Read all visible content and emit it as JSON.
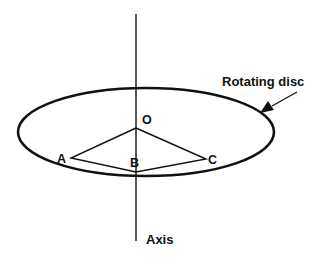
{
  "diagram": {
    "title_label": "Rotating disc",
    "axis_label": "Axis",
    "points": {
      "O": "O",
      "A": "A",
      "B": "B",
      "C": "C"
    },
    "colors": {
      "stroke": "#111111",
      "background": "#ffffff"
    }
  }
}
